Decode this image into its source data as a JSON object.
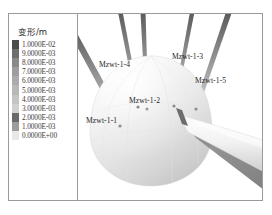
{
  "figure": {
    "background_color": "#ffffff",
    "frame_color": "#9a9a9a"
  },
  "legend": {
    "title": "变形/m",
    "rows": [
      {
        "value": "1.0000E-02",
        "color": "#4c4c4c"
      },
      {
        "value": "9.0000E-03",
        "color": "#6e6e6e"
      },
      {
        "value": "8.0000E-03",
        "color": "#8a8a8a"
      },
      {
        "value": "7.0000E-03",
        "color": "#9e9e9e"
      },
      {
        "value": "6.0000E-03",
        "color": "#ababab"
      },
      {
        "value": "5.0000E-03",
        "color": "#b8b8b8"
      },
      {
        "value": "4.0000E-03",
        "color": "#c4c4c4"
      },
      {
        "value": "3.0000E-03",
        "color": "#d0d0d0"
      },
      {
        "value": "2.0000E-03",
        "color": "#6a6a6a"
      },
      {
        "value": "1.0000E-03",
        "color": "#9c9c9c"
      },
      {
        "value": "0.0000E+00",
        "color": "#e8e8e8"
      }
    ]
  },
  "annotations": [
    {
      "label": "Mzwt-1-4",
      "x": 21,
      "y": 46
    },
    {
      "label": "Mzwt-1-3",
      "x": 94,
      "y": 38
    },
    {
      "label": "Mzwt-1-5",
      "x": 117,
      "y": 62
    },
    {
      "label": "Mzwt-1-2",
      "x": 51,
      "y": 82
    },
    {
      "label": "Mzwt-1-1",
      "x": 8,
      "y": 102
    }
  ],
  "chart_data": {
    "type": "heatmap",
    "title": "变形/m",
    "xlabel": "",
    "ylabel": "",
    "colorbar_label": "变形/m",
    "colorbar_levels": [
      0.01,
      0.009,
      0.008,
      0.007,
      0.006,
      0.005,
      0.004,
      0.003,
      0.002,
      0.001,
      0
    ],
    "colorbar_tick_labels": [
      "1.0000E-02",
      "9.0000E-03",
      "8.0000E-03",
      "7.0000E-03",
      "6.0000E-03",
      "5.0000E-03",
      "4.0000E-03",
      "3.0000E-03",
      "2.0000E-03",
      "1.0000E-03",
      "0.0000E+00"
    ],
    "units": "m",
    "grid": false,
    "legend_position": "left",
    "annotations": [
      "Mzwt-1-1",
      "Mzwt-1-2",
      "Mzwt-1-3",
      "Mzwt-1-4",
      "Mzwt-1-5"
    ]
  }
}
